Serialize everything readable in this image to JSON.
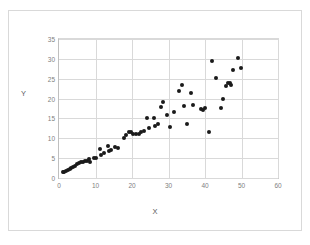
{
  "chart_data": {
    "type": "scatter",
    "title": "",
    "xlabel": "X",
    "ylabel": "Y",
    "xlim": [
      0,
      60
    ],
    "ylim": [
      0,
      35
    ],
    "xticks": [
      0,
      10,
      20,
      30,
      40,
      50,
      60
    ],
    "yticks": [
      0,
      5,
      10,
      15,
      20,
      25,
      30,
      35
    ],
    "grid": true,
    "legend": false,
    "marker_color": "#1a1a1a",
    "series": [
      {
        "name": "data",
        "points": [
          [
            1.0,
            1.6
          ],
          [
            1.4,
            1.5
          ],
          [
            1.9,
            1.8
          ],
          [
            2.4,
            2.0
          ],
          [
            2.9,
            2.2
          ],
          [
            3.4,
            2.5
          ],
          [
            3.9,
            2.8
          ],
          [
            4.4,
            3.1
          ],
          [
            4.9,
            3.4
          ],
          [
            5.4,
            3.7
          ],
          [
            6.0,
            4.0
          ],
          [
            6.5,
            4.1
          ],
          [
            7.0,
            4.2
          ],
          [
            7.6,
            4.4
          ],
          [
            8.1,
            4.7
          ],
          [
            8.6,
            4.0
          ],
          [
            9.6,
            5.1
          ],
          [
            10.1,
            5.0
          ],
          [
            11.2,
            7.4
          ],
          [
            11.5,
            5.7
          ],
          [
            12.4,
            6.3
          ],
          [
            13.4,
            8.0
          ],
          [
            13.8,
            6.7
          ],
          [
            14.3,
            7.0
          ],
          [
            15.3,
            7.9
          ],
          [
            16.2,
            7.5
          ],
          [
            17.8,
            10.0
          ],
          [
            18.4,
            10.8
          ],
          [
            19.1,
            11.7
          ],
          [
            19.7,
            11.5
          ],
          [
            20.4,
            11.1
          ],
          [
            21.1,
            11.0
          ],
          [
            21.8,
            11.2
          ],
          [
            22.5,
            11.6
          ],
          [
            23.2,
            11.9
          ],
          [
            24.2,
            15.1
          ],
          [
            24.6,
            12.5
          ],
          [
            25.9,
            15.2
          ],
          [
            26.3,
            13.2
          ],
          [
            27.0,
            13.5
          ],
          [
            28.0,
            18.0
          ],
          [
            28.5,
            19.2
          ],
          [
            29.7,
            15.9
          ],
          [
            30.4,
            12.8
          ],
          [
            31.6,
            16.7
          ],
          [
            32.9,
            22.0
          ],
          [
            33.6,
            23.3
          ],
          [
            34.3,
            18.2
          ],
          [
            35.2,
            13.7
          ],
          [
            36.2,
            21.5
          ],
          [
            36.8,
            18.3
          ],
          [
            38.8,
            17.5
          ],
          [
            39.4,
            17.0
          ],
          [
            39.9,
            17.6
          ],
          [
            41.0,
            11.6
          ],
          [
            41.9,
            29.4
          ],
          [
            43.1,
            25.2
          ],
          [
            44.3,
            17.7
          ],
          [
            44.9,
            19.8
          ],
          [
            45.8,
            23.2
          ],
          [
            46.4,
            23.9
          ],
          [
            46.9,
            23.9
          ],
          [
            47.2,
            23.4
          ],
          [
            47.8,
            27.3
          ],
          [
            49.0,
            30.2
          ],
          [
            49.8,
            27.7
          ]
        ]
      }
    ]
  },
  "axis": {
    "y_title": "Y",
    "x_title": "X"
  }
}
